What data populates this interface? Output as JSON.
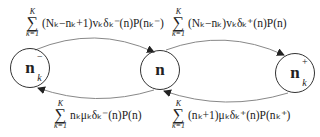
{
  "nodes": [
    {
      "id": "n-minus",
      "base": "n",
      "sup": "−",
      "sub": "k"
    },
    {
      "id": "n",
      "base": "n",
      "sup": "",
      "sub": ""
    },
    {
      "id": "n-plus",
      "base": "n",
      "sup": "+",
      "sub": "k"
    }
  ],
  "edges": [
    {
      "from": "n",
      "to": "n-minus",
      "sum_upper": "K",
      "sum_lower": "k=1",
      "expression": "(N_k − n_k + 1) v_k δ_k^− (n) P(n_k^−)",
      "display": "(Nₖ−nₖ+1)vₖδₖ⁻(n)P(nₖ⁻)"
    },
    {
      "from": "n-plus",
      "to": "n",
      "sum_upper": "K",
      "sum_lower": "k=1",
      "expression": "(N_k − n_k) v_k δ_k^+ (n) P(n)",
      "display": "(Nₖ−nₖ)vₖδₖ⁺(n)P(n)"
    },
    {
      "from": "n-minus",
      "to": "n",
      "sum_upper": "K",
      "sum_lower": "k=1",
      "expression": "n_k μ_k δ_k^− (n) P(n)",
      "display": "nₖμₖδₖ⁻(n)P(n)"
    },
    {
      "from": "n",
      "to": "n-plus",
      "sum_upper": "K",
      "sum_lower": "k=1",
      "expression": "(n_k + 1) μ_k δ_k^+ (n) P(n_k^+)",
      "display": "(nₖ+1)μₖδₖ⁺(n)P(nₖ⁺)"
    }
  ],
  "colors": {
    "stroke": "#333333",
    "edge": "#888888",
    "background": "#ffffff"
  }
}
